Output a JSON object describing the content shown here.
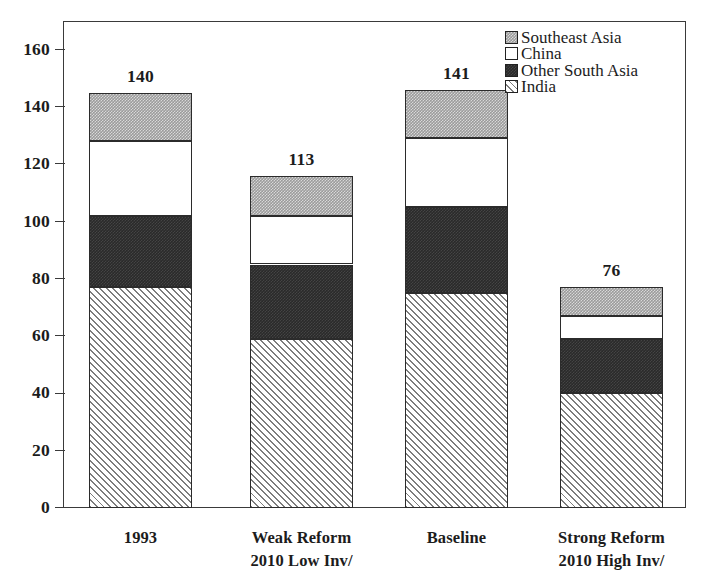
{
  "chart_data": {
    "type": "bar",
    "subtype": "stacked-bar",
    "title": "",
    "xlabel": "",
    "ylabel": "",
    "ylim": [
      0,
      170
    ],
    "yticks": [
      0,
      20,
      40,
      60,
      80,
      100,
      120,
      140,
      160
    ],
    "ytick_labels": [
      "0",
      "20",
      "40",
      "60",
      "80",
      "100",
      "120",
      "140",
      "160"
    ],
    "grid": false,
    "legend_position": "top-right",
    "categories": [
      "1993",
      "Weak Reform 2010 Low Inv/",
      "Baseline",
      "Strong Reform 2010 High Inv/"
    ],
    "category_lines": [
      [
        "1993",
        ""
      ],
      [
        "Weak Reform",
        "2010 Low Inv/"
      ],
      [
        "Baseline",
        ""
      ],
      [
        "Strong Reform",
        "2010 High Inv/"
      ]
    ],
    "series": [
      {
        "name": "India",
        "values": [
          77,
          59,
          75,
          40
        ],
        "fill": "india",
        "color": "#e8e8e8"
      },
      {
        "name": "Other South Asia",
        "values": [
          25,
          26,
          30,
          19
        ],
        "fill": "other",
        "color": "#2a2a2a"
      },
      {
        "name": "China",
        "values": [
          26,
          17,
          24,
          8
        ],
        "fill": "china",
        "color": "#ffffff"
      },
      {
        "name": "Southeast Asia",
        "values": [
          17,
          14,
          17,
          10
        ],
        "fill": "se",
        "color": "#9b9b9b"
      }
    ],
    "stack_tops": [
      [
        77,
        102,
        128,
        145
      ],
      [
        59,
        85,
        102,
        116
      ],
      [
        75,
        105,
        129,
        146
      ],
      [
        40,
        59,
        67,
        77
      ]
    ],
    "bar_totals": [
      145,
      116,
      146,
      77
    ],
    "bar_value_labels": [
      "140",
      "113",
      "141",
      "76"
    ],
    "legend": [
      {
        "label": "Southeast Asia",
        "fill": "se"
      },
      {
        "label": "China",
        "fill": "china"
      },
      {
        "label": "Other South Asia",
        "fill": "other"
      },
      {
        "label": "India",
        "fill": "india"
      }
    ]
  }
}
